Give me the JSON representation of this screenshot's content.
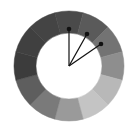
{
  "diagram": {
    "type": "segmented-ring",
    "center": [
      69,
      66
    ],
    "outer_radius": 55,
    "inner_radius": 33,
    "segments": [
      {
        "start": -105,
        "end": -75,
        "color": "#4a4a4a"
      },
      {
        "start": -75,
        "end": -45,
        "color": "#5a5a5a"
      },
      {
        "start": -45,
        "end": -15,
        "color": "#737373"
      },
      {
        "start": -15,
        "end": 15,
        "color": "#8e8e8e"
      },
      {
        "start": 15,
        "end": 45,
        "color": "#b8b8b8"
      },
      {
        "start": 45,
        "end": 75,
        "color": "#c4c4c4"
      },
      {
        "start": 75,
        "end": 105,
        "color": "#9a9a9a"
      },
      {
        "start": 105,
        "end": 135,
        "color": "#7a7a7a"
      },
      {
        "start": 135,
        "end": 165,
        "color": "#5e5e5e"
      },
      {
        "start": 165,
        "end": 195,
        "color": "#3c3c3c"
      },
      {
        "start": 195,
        "end": 225,
        "color": "#404040"
      },
      {
        "start": 225,
        "end": 255,
        "color": "#444444"
      }
    ],
    "pointers": [
      {
        "x": 69,
        "y": 29
      },
      {
        "x": 87,
        "y": 34
      },
      {
        "x": 101,
        "y": 44
      }
    ],
    "pointer_color": "#111111"
  }
}
